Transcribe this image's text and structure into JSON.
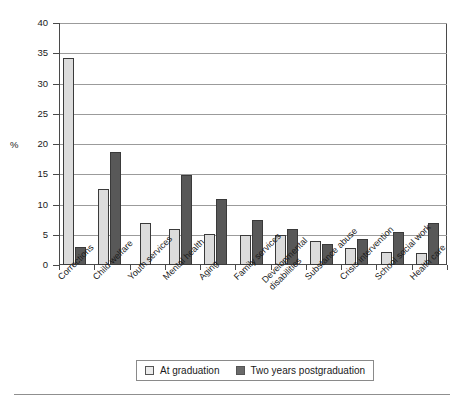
{
  "chart_data": {
    "type": "bar",
    "title": "",
    "xlabel": "",
    "ylabel": "%",
    "ylim": [
      0,
      40
    ],
    "yticks": [
      0,
      5,
      10,
      15,
      20,
      25,
      30,
      35,
      40
    ],
    "ytick_labels": [
      "0",
      "5",
      "10",
      "15",
      "20",
      "25",
      "30",
      "35",
      "40"
    ],
    "grid": true,
    "legend_position": "bottom",
    "categories": [
      "Corrections",
      "Child welfare",
      "Youth services",
      "Mental health",
      "Aging",
      "Family services",
      "Developmental disabilities",
      "Substance abuse",
      "Crisis intervention",
      "School social work",
      "Health care"
    ],
    "category_lines": [
      [
        "Corrections"
      ],
      [
        "Child welfare"
      ],
      [
        "Youth services"
      ],
      [
        "Mental health"
      ],
      [
        "Aging"
      ],
      [
        "Family services"
      ],
      [
        "Developmental",
        "disabilities"
      ],
      [
        "Substance abuse"
      ],
      [
        "Crisis intervention"
      ],
      [
        "School social work"
      ],
      [
        "Health care"
      ]
    ],
    "series": [
      {
        "name": "At graduation",
        "color": "#dcdcdc",
        "values": [
          34.3,
          12.5,
          6.9,
          6.0,
          5.2,
          5.0,
          5.0,
          4.0,
          2.8,
          2.2,
          2.0
        ]
      },
      {
        "name": "Two years postgraduation",
        "color": "#585858",
        "values": [
          3.0,
          18.6,
          null,
          14.9,
          10.9,
          7.5,
          5.9,
          3.5,
          4.3,
          5.4,
          7.0
        ]
      }
    ]
  },
  "legend": {
    "items": [
      {
        "label": "At graduation",
        "swatch": "light-swatch"
      },
      {
        "label": "Two years postgraduation",
        "swatch": "dark-swatch"
      }
    ]
  },
  "axis": {
    "y_title": "%"
  }
}
